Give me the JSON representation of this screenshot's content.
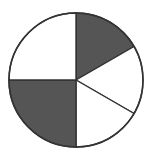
{
  "diagram": {
    "type": "fraction-circle",
    "center": [
      76,
      80
    ],
    "radius": 67,
    "stroke_color": "#333333",
    "shaded_color": "#555555",
    "unshaded_color": "#ffffff",
    "sectors": [
      {
        "start_deg": 0,
        "end_deg": 60,
        "shaded": true
      },
      {
        "start_deg": 60,
        "end_deg": 120,
        "shaded": false
      },
      {
        "start_deg": 120,
        "end_deg": 180,
        "shaded": false
      },
      {
        "start_deg": 180,
        "end_deg": 270,
        "shaded": true
      },
      {
        "start_deg": 270,
        "end_deg": 360,
        "shaded": false
      }
    ]
  }
}
